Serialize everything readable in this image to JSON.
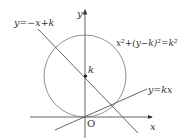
{
  "diagram": {
    "axes": {
      "x_label": "x",
      "y_label": "y",
      "origin_label": "O"
    },
    "circle": {
      "equation_label": "x²+(y−k)²=k²",
      "center_label": "k"
    },
    "lines": [
      {
        "name": "line-neg",
        "label": "y=−x+k"
      },
      {
        "name": "line-kx",
        "label": "y=kx"
      }
    ],
    "colors": {
      "stroke": "#555555",
      "text": "#333333",
      "background": "#ffffff"
    }
  }
}
